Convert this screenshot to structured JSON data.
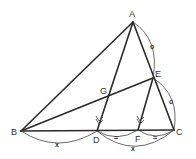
{
  "diagram": {
    "type": "geometry-triangle",
    "points": {
      "A": {
        "label": "A",
        "x": 133,
        "y": 22
      },
      "B": {
        "label": "B",
        "x": 21,
        "y": 131
      },
      "C": {
        "label": "C",
        "x": 174,
        "y": 130
      },
      "D": {
        "label": "D",
        "x": 97,
        "y": 131
      },
      "E": {
        "label": "E",
        "x": 153,
        "y": 78
      },
      "F": {
        "label": "F",
        "x": 138,
        "y": 130
      },
      "G": {
        "label": "G",
        "x": 108,
        "y": 96
      }
    },
    "segments": [
      "AB",
      "AC",
      "BC",
      "AD",
      "BE",
      "EF"
    ],
    "equal_marks": {
      "AE": "o",
      "EC": "o",
      "BD": "x",
      "DC": "x",
      "DF": "=",
      "FC": "="
    },
    "parallel_marks": [
      "AD",
      "EF"
    ]
  }
}
